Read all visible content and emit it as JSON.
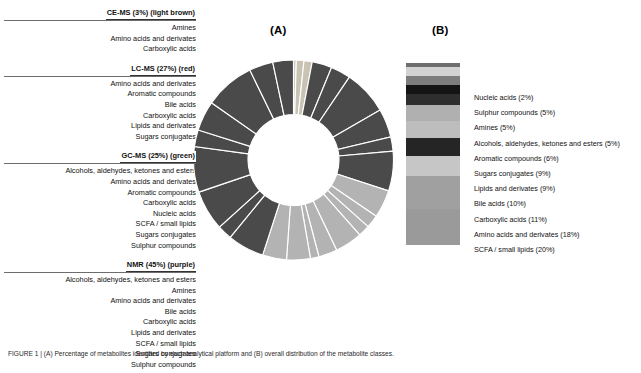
{
  "panels": {
    "a_label": "(A)",
    "b_label": "(B)"
  },
  "platforms": [
    {
      "header": "CE-MS (3%) (light brown)",
      "name": "CE-MS",
      "percent": 3,
      "color": "#c9c3b4",
      "items": [
        "Amines",
        "Amino acids and derivates",
        "Carboxylic acids"
      ]
    },
    {
      "header": "LC-MS (27%) (red)",
      "name": "LC-MS",
      "percent": 27,
      "color": "#4a4a4a",
      "items": [
        "Amino acids and derivates",
        "Aromatic compounds",
        "Bile acids",
        "Carboxylic acids",
        "Lipids and derivates",
        "Sugars conjugates"
      ]
    },
    {
      "header": "GC-MS (25%) (green)",
      "name": "GC-MS",
      "percent": 25,
      "color": "#b3b3b3",
      "items": [
        "Alcohols, aldehydes, ketones and esters",
        "Amino acids and derivates",
        "Aromatic compounds",
        "Carboxylic acids",
        "Nucleic acids",
        "SCFA / small lipids",
        "Sugars conjugates",
        "Sulphur compounds"
      ]
    },
    {
      "header": "NMR (45%) (purple)",
      "name": "NMR",
      "percent": 45,
      "color": "#4a4a4a",
      "items": [
        "Alcohols, aldehydes, ketones and esters",
        "Amines",
        "Amino acids and derivates",
        "Bile acids",
        "Carboxylic acids",
        "Lipids and derivates",
        "SCFA / small lipids",
        "Sugars conjugates",
        "Sulphur compounds"
      ]
    }
  ],
  "legend_b": [
    {
      "label": "Nucleic acids (2%)",
      "percent": 2,
      "color": "#6e6e6e"
    },
    {
      "label": "Sulphur compounds (5%)",
      "percent": 5,
      "color": "#d2d2d2"
    },
    {
      "label": "Amines (5%)",
      "percent": 5,
      "color": "#7d7d7d"
    },
    {
      "label": "Alcohols, aldehydes, ketones and esters (5%)",
      "percent": 5,
      "color": "#141414"
    },
    {
      "label": "Aromatic compounds (6%)",
      "percent": 6,
      "color": "#2e2e2e"
    },
    {
      "label": "Sugars conjugates (9%)",
      "percent": 9,
      "color": "#b0b0b0"
    },
    {
      "label": "Lipids and derivates (9%)",
      "percent": 9,
      "color": "#bdbdbd"
    },
    {
      "label": "Bile acids (10%)",
      "percent": 10,
      "color": "#252525"
    },
    {
      "label": "Carboxylic acids (11%)",
      "percent": 11,
      "color": "#c6c6c6"
    },
    {
      "label": "Amino acids and derivates (18%)",
      "percent": 18,
      "color": "#a0a0a0"
    },
    {
      "label": "SCFA / small lipids (20%)",
      "percent": 20,
      "color": "#9a9a9a"
    }
  ],
  "chart_data": {
    "type": "pie",
    "charts": [
      {
        "id": "A",
        "type": "pie",
        "variant": "donut",
        "legend": "left-list",
        "groups": [
          {
            "name": "CE-MS",
            "percent": 3,
            "color": "#c9c3b4",
            "slices": 3
          },
          {
            "name": "LC-MS",
            "percent": 27,
            "color": "#4a4a4a",
            "slices": 6
          },
          {
            "name": "GC-MS",
            "percent": 25,
            "color": "#b3b3b3",
            "slices": 8
          },
          {
            "name": "NMR",
            "percent": 45,
            "color": "#4a4a4a",
            "slices": 9
          }
        ],
        "categories": [
          "CE-MS",
          "LC-MS",
          "GC-MS",
          "NMR"
        ],
        "values": [
          3,
          27,
          25,
          45
        ]
      },
      {
        "id": "B",
        "type": "bar",
        "variant": "stacked-vertical-100",
        "legend": "right",
        "categories": [
          "Nucleic acids",
          "Sulphur compounds",
          "Amines",
          "Alcohols, aldehydes, ketones and esters",
          "Aromatic compounds",
          "Sugars conjugates",
          "Lipids and derivates",
          "Bile acids",
          "Carboxylic acids",
          "Amino acids and derivates",
          "SCFA / small lipids"
        ],
        "values": [
          2,
          5,
          5,
          5,
          6,
          9,
          9,
          10,
          11,
          18,
          20
        ],
        "ylabel": "Percent of metabolites",
        "ylim": [
          0,
          100
        ]
      }
    ]
  },
  "caption": {
    "text": "FIGURE 1 | (A) Percentage of metabolites identified by each analytical platform and (B) overall distribution of the metabolite classes."
  }
}
